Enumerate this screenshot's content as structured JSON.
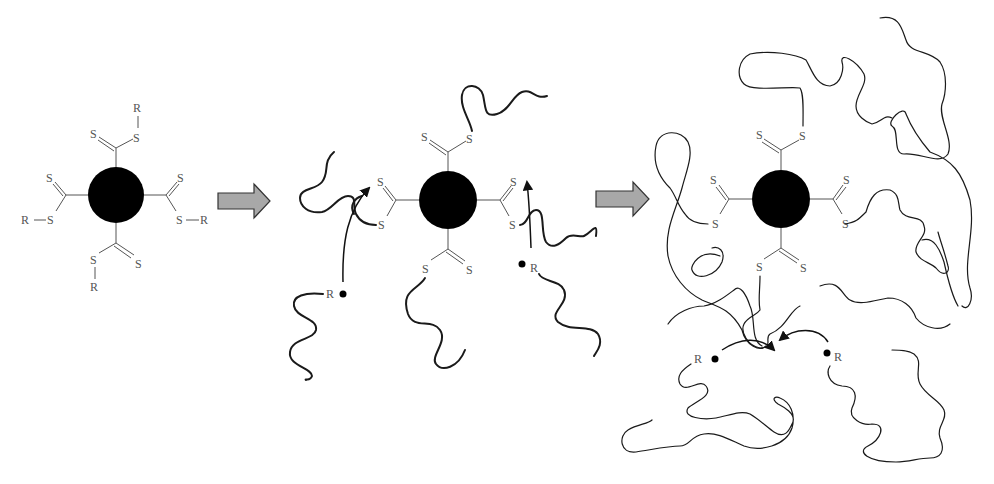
{
  "diagram": {
    "type": "reaction-scheme",
    "colors": {
      "core": "#000000",
      "bonds": "#555555",
      "atom_labels": "#555555",
      "chains": "#1a1a1a",
      "process_arrow_fill": "#a8a8a8",
      "process_arrow_stroke": "#333333",
      "background": "#ffffff"
    },
    "labels": {
      "sulfur": "S",
      "r_group": "R"
    },
    "stages": [
      {
        "name": "stage-1-raft-agent",
        "core": "filled-circle",
        "arms": 4,
        "arm_end_group": "R",
        "chains": "none"
      },
      {
        "name": "stage-2-initial-growth",
        "core": "filled-circle",
        "arms": 4,
        "chains": "short",
        "free_radicals": 2,
        "radical_label": "R"
      },
      {
        "name": "stage-3-star-polymer",
        "core": "filled-circle",
        "arms": 4,
        "chains": "long",
        "free_radicals": 2,
        "radical_label": "R"
      }
    ],
    "arrows": [
      {
        "from": "stage-1",
        "to": "stage-2",
        "style": "block-arrow"
      },
      {
        "from": "stage-2",
        "to": "stage-3",
        "style": "block-arrow"
      }
    ]
  }
}
